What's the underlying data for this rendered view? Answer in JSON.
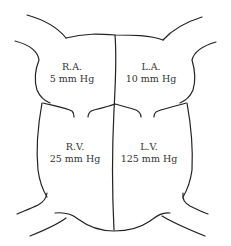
{
  "diagram": {
    "type": "heart-chambers-pressure",
    "stroke_color": "#222222",
    "chambers": [
      {
        "id": "ra",
        "name": "R.A.",
        "pressure": "5 mm Hg"
      },
      {
        "id": "la",
        "name": "L.A.",
        "pressure": "10 mm Hg"
      },
      {
        "id": "rv",
        "name": "R.V.",
        "pressure": "25 mm Hg"
      },
      {
        "id": "lv",
        "name": "L.V.",
        "pressure": "125 mm Hg"
      }
    ]
  }
}
